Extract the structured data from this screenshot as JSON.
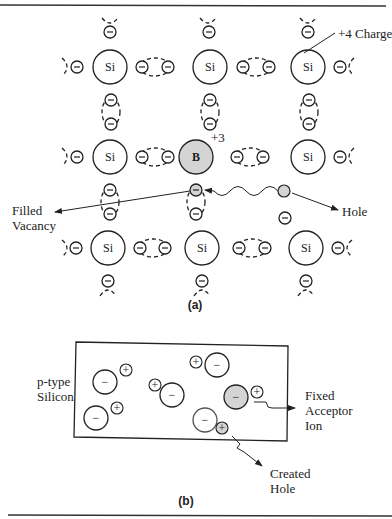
{
  "figure_a": {
    "caption": "(a)",
    "atoms": [
      {
        "label": "Si",
        "x": 110,
        "y": 67,
        "type": "si"
      },
      {
        "label": "Si",
        "x": 210,
        "y": 67,
        "type": "si"
      },
      {
        "label": "Si",
        "x": 308,
        "y": 67,
        "type": "si"
      },
      {
        "label": "Si",
        "x": 110,
        "y": 157,
        "type": "si"
      },
      {
        "label": "B",
        "x": 196,
        "y": 157,
        "type": "boron"
      },
      {
        "label": "Si",
        "x": 308,
        "y": 157,
        "type": "si"
      },
      {
        "label": "Si",
        "x": 108,
        "y": 248,
        "type": "si"
      },
      {
        "label": "Si",
        "x": 202,
        "y": 248,
        "type": "si"
      },
      {
        "label": "Si",
        "x": 306,
        "y": 248,
        "type": "si"
      }
    ],
    "labels": {
      "charge_si": "+4 Charge",
      "charge_b": "+3",
      "filled_vacancy_line1": "Filled",
      "filled_vacancy_line2": "Vacancy",
      "hole": "Hole"
    }
  },
  "figure_b": {
    "caption": "(b)",
    "material_line1": "p-type",
    "material_line2": "Silicon",
    "acceptor_line1": "Fixed",
    "acceptor_line2": "Acceptor",
    "acceptor_line3": "Ion",
    "hole_line1": "Created",
    "hole_line2": "Hole",
    "minus_symbol": "−",
    "plus_symbol": "+"
  },
  "colors": {
    "stroke": "#222222",
    "shaded": "#d4d4d4",
    "background": "#ffffff"
  }
}
